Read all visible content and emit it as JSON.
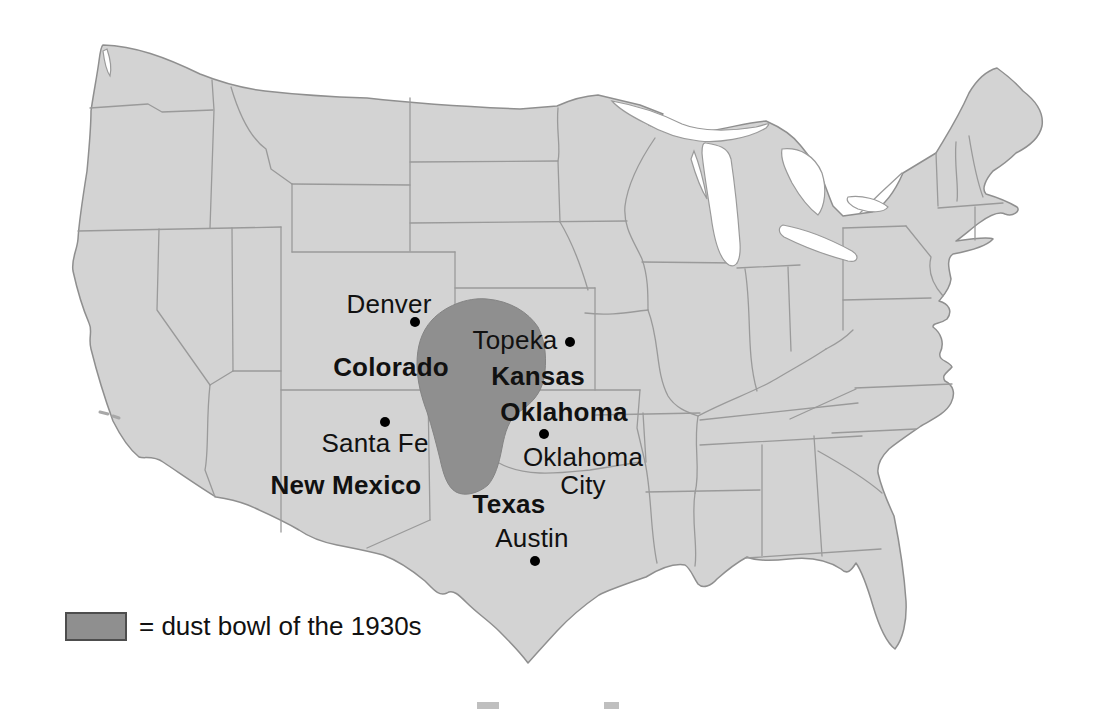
{
  "map": {
    "subject": "dust bowl of the 1930s",
    "region": "United States"
  },
  "labels": {
    "denver": {
      "text": "Denver"
    },
    "colorado": {
      "text": "Colorado"
    },
    "topeka": {
      "text": "Topeka"
    },
    "kansas": {
      "text": "Kansas"
    },
    "oklahoma": {
      "text": "Oklahoma"
    },
    "oklahoma_city": {
      "line1": "Oklahoma",
      "line2": "City"
    },
    "santa_fe": {
      "text": "Santa Fe"
    },
    "new_mexico": {
      "text": "New Mexico"
    },
    "texas": {
      "text": "Texas"
    },
    "austin": {
      "text": "Austin"
    }
  },
  "legend": {
    "text": "= dust bowl of the 1930s",
    "swatch_color": "#8f8f8f"
  },
  "colors": {
    "background": "#ffffff",
    "map_fill": "#d3d3d3",
    "state_border": "#9a9a9a",
    "dust_bowl": "#8f8f8f",
    "label_text": "#111111",
    "city_dot": "#000000"
  }
}
